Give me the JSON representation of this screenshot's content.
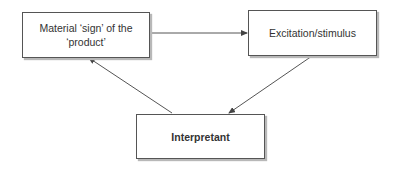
{
  "diagram": {
    "type": "cycle",
    "nodes": [
      {
        "id": "sign",
        "label": "Material ‘sign’ of the ‘product’",
        "line1": "Material ‘sign’ of the",
        "line2": "‘product’",
        "bold": false
      },
      {
        "id": "stimulus",
        "label": "Excitation/stimulus",
        "bold": false
      },
      {
        "id": "interpretant",
        "label": "Interpretant",
        "bold": true
      }
    ],
    "edges": [
      {
        "from": "sign",
        "to": "stimulus"
      },
      {
        "from": "stimulus",
        "to": "interpretant"
      },
      {
        "from": "interpretant",
        "to": "sign"
      }
    ],
    "colors": {
      "stroke": "#555555",
      "shadow": "#b8b8b8",
      "text": "#333333"
    }
  }
}
